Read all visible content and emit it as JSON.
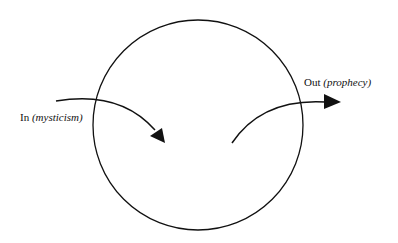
{
  "diagram": {
    "in_label": {
      "main": "In",
      "paren": "(mysticism)"
    },
    "out_label": {
      "main": "Out",
      "paren": "(prophecy)"
    },
    "colors": {
      "stroke": "#111111",
      "background": "#ffffff"
    }
  }
}
